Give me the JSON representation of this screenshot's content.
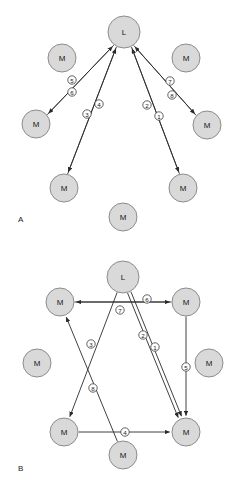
{
  "figure": {
    "width": 241,
    "height": 485,
    "background": "#ffffff",
    "node_fill": "#d9d9d9",
    "node_stroke": "#8c8c8c",
    "edge_color": "#2b2b2b",
    "tag_fill": "#ffffff"
  },
  "panels": [
    {
      "id": "panel-a",
      "letter": "A",
      "letter_x": 18,
      "letter_y": 219,
      "topology": "centralized-star",
      "nodes": [
        {
          "id": "A-L",
          "label": "L",
          "x": 124,
          "y": 32,
          "r": 16
        },
        {
          "id": "A-M1",
          "label": "M",
          "x": 62,
          "y": 58,
          "r": 14
        },
        {
          "id": "A-M2",
          "label": "M",
          "x": 186,
          "y": 58,
          "r": 14
        },
        {
          "id": "A-M3",
          "label": "M",
          "x": 36,
          "y": 124,
          "r": 14
        },
        {
          "id": "A-M4",
          "label": "M",
          "x": 207,
          "y": 125,
          "r": 14
        },
        {
          "id": "A-M5",
          "label": "M",
          "x": 64,
          "y": 188,
          "r": 14
        },
        {
          "id": "A-M6",
          "label": "M",
          "x": 183,
          "y": 188,
          "r": 14
        },
        {
          "id": "A-M7",
          "label": "M",
          "x": 123,
          "y": 217,
          "r": 14
        }
      ],
      "edges": [
        {
          "id": "A-e5",
          "tag": "5",
          "from": "A-M3",
          "to": "A-L",
          "tag_x": 72,
          "tag_y": 80,
          "offset": 1.7,
          "arrow_at": "to"
        },
        {
          "id": "A-e6",
          "tag": "6",
          "from": "A-L",
          "to": "A-M3",
          "tag_x": 72,
          "tag_y": 92,
          "offset": -1.7,
          "arrow_at": "to"
        },
        {
          "id": "A-e3",
          "tag": "3",
          "from": "A-M5",
          "to": "A-L",
          "tag_x": 87,
          "tag_y": 114,
          "offset": -1.7,
          "arrow_at": "to"
        },
        {
          "id": "A-e4",
          "tag": "4",
          "from": "A-L",
          "to": "A-M5",
          "tag_x": 99,
          "tag_y": 104,
          "offset": 1.7,
          "arrow_at": "to"
        },
        {
          "id": "A-e2",
          "tag": "2",
          "from": "A-M6",
          "to": "A-L",
          "tag_x": 147,
          "tag_y": 105,
          "offset": 1.7,
          "arrow_at": "to"
        },
        {
          "id": "A-e1",
          "tag": "1",
          "from": "A-L",
          "to": "A-M6",
          "tag_x": 159,
          "tag_y": 116,
          "offset": -1.7,
          "arrow_at": "to"
        },
        {
          "id": "A-e7",
          "tag": "7",
          "from": "A-M4",
          "to": "A-L",
          "tag_x": 170,
          "tag_y": 81,
          "offset": -1.7,
          "arrow_at": "to"
        },
        {
          "id": "A-e8",
          "tag": "8",
          "from": "A-L",
          "to": "A-M4",
          "tag_x": 172,
          "tag_y": 95,
          "offset": 1.7,
          "arrow_at": "to"
        }
      ]
    },
    {
      "id": "panel-b",
      "letter": "B",
      "letter_x": 18,
      "letter_y": 468,
      "topology": "distributed-mesh",
      "nodes": [
        {
          "id": "B-L",
          "label": "L",
          "x": 123,
          "y": 277,
          "r": 16
        },
        {
          "id": "B-M1",
          "label": "M",
          "x": 60,
          "y": 302,
          "r": 14
        },
        {
          "id": "B-M2",
          "label": "M",
          "x": 186,
          "y": 302,
          "r": 14
        },
        {
          "id": "B-M3",
          "label": "M",
          "x": 37,
          "y": 363,
          "r": 14
        },
        {
          "id": "B-M4",
          "label": "M",
          "x": 209,
          "y": 363,
          "r": 14
        },
        {
          "id": "B-M5",
          "label": "M",
          "x": 64,
          "y": 432,
          "r": 14
        },
        {
          "id": "B-M6",
          "label": "M",
          "x": 186,
          "y": 432,
          "r": 14
        },
        {
          "id": "B-M7",
          "label": "M",
          "x": 123,
          "y": 455,
          "r": 14
        }
      ],
      "edges": [
        {
          "id": "B-e1",
          "tag": "1",
          "from": "B-L",
          "to": "B-M6",
          "tag_x": 155,
          "tag_y": 347,
          "offset": -1.8,
          "arrow_at": "to"
        },
        {
          "id": "B-e2",
          "tag": "2",
          "from": "B-L",
          "to": "B-M6",
          "tag_x": 143,
          "tag_y": 335,
          "offset": 1.8,
          "arrow_at": "to"
        },
        {
          "id": "B-e3",
          "tag": "3",
          "from": "B-L",
          "to": "B-M5",
          "tag_x": 91,
          "tag_y": 344,
          "offset": 0,
          "arrow_at": "to"
        },
        {
          "id": "B-e4",
          "tag": "4",
          "from": "B-M5",
          "to": "B-M6",
          "tag_x": 125,
          "tag_y": 432,
          "offset": 0,
          "arrow_at": "to"
        },
        {
          "id": "B-e5",
          "tag": "5",
          "from": "B-M2",
          "to": "B-M6",
          "tag_x": 186,
          "tag_y": 367,
          "offset": 0,
          "arrow_at": "to"
        },
        {
          "id": "B-e6",
          "tag": "6",
          "from": "B-M1",
          "to": "B-M2",
          "tag_x": 147,
          "tag_y": 299,
          "offset": 0,
          "arrow_at": "to"
        },
        {
          "id": "B-e7",
          "tag": "7",
          "from": "B-M2",
          "to": "B-M1",
          "tag_x": 120,
          "tag_y": 310,
          "offset": 0,
          "arrow_at": "to"
        },
        {
          "id": "B-e8",
          "tag": "8",
          "from": "B-M7",
          "to": "B-M1",
          "tag_x": 93,
          "tag_y": 388,
          "offset": 0,
          "arrow_at": "to"
        }
      ]
    }
  ]
}
